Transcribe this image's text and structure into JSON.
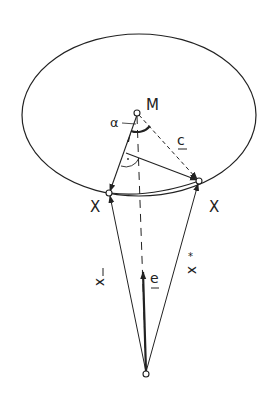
{
  "diagram": {
    "labels": {
      "center": "M",
      "angle": "α",
      "vector_c": "c",
      "point_left": "X",
      "point_right": "X",
      "vector_xbar": "x",
      "vector_e": "e",
      "vector_xstar": "x"
    },
    "colors": {
      "stroke": "#222222",
      "background": "#ffffff"
    }
  }
}
